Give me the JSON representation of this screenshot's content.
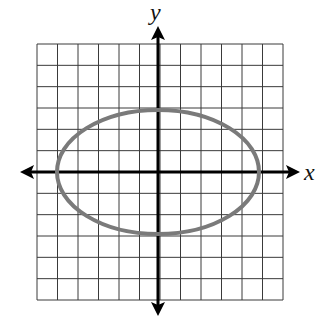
{
  "figure": {
    "type": "coordinate-grid-ellipse",
    "x_axis_label": "x",
    "y_axis_label": "y",
    "grid": {
      "cols": 12,
      "rows": 12,
      "x_min": -6,
      "x_max": 6,
      "y_min": -6,
      "y_max": 6
    },
    "ellipse": {
      "center": [
        0,
        0
      ],
      "semi_major_x": 5,
      "semi_minor_y": 3,
      "stroke_color": "#7a7a7a"
    },
    "colors": {
      "grid": "#3a3a3a",
      "axes": "#000000",
      "background": "#ffffff"
    }
  }
}
